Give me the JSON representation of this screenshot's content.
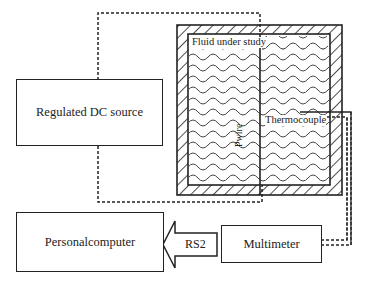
{
  "diagram": {
    "blocks": {
      "dc_source": "Regulated DC source",
      "computer": "Personalcomputer",
      "multimeter": "Multimeter"
    },
    "labels": {
      "fluid": "Fluid under study",
      "wire": "Pwire",
      "thermocouple": "Thermocouple",
      "link": "RS2"
    },
    "colors": {
      "line": "#222222",
      "background": "#ffffff"
    }
  }
}
